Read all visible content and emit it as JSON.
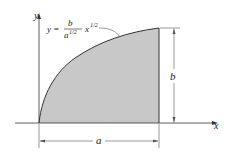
{
  "figure": {
    "curve_equation": {
      "lhs": "y =",
      "numerator": "b",
      "denominator": "a",
      "denominator_exp": "1/2",
      "variable": "x",
      "variable_exp": "1/2"
    },
    "axes": {
      "x_label": "x",
      "y_label": "y"
    },
    "dimensions": {
      "width_label": "a",
      "height_label": "b"
    },
    "colors": {
      "fill": "#c8c8c8",
      "stroke": "#333333"
    }
  }
}
